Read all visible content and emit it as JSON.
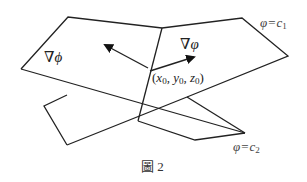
{
  "figure": {
    "caption": "圖 2",
    "labels": {
      "grad_phi_upright": "∇ϕ",
      "grad_varphi": "∇φ",
      "point": "(x0, y0, z0)",
      "surface_c1": "φ = c1",
      "surface_c2": "φ = c2"
    },
    "point_parts": {
      "open": "(",
      "x": "x",
      "y": "y",
      "z": "z",
      "sub": "0",
      "close": ")"
    },
    "surface_c1_parts": {
      "lhs": "φ",
      "eq": "=",
      "c": "c",
      "sub": "1"
    },
    "surface_c2_parts": {
      "lhs": "φ",
      "eq": "=",
      "c": "c",
      "sub": "2"
    },
    "grad_phi_label": "∇ϕ",
    "grad_varphi_label": "∇φ",
    "colors": {
      "line": "#222222",
      "text": "#222222",
      "background": "#ffffff"
    }
  }
}
